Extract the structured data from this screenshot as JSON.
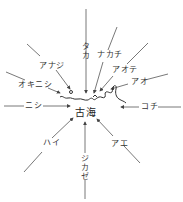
{
  "diagram": {
    "center_label": "古海",
    "winds": [
      {
        "id": "taka",
        "label": "タカ",
        "direction": "N"
      },
      {
        "id": "nakachi",
        "label": "ナカチ",
        "direction": "NNE"
      },
      {
        "id": "aote",
        "label": "アオテ",
        "direction": "NE"
      },
      {
        "id": "ao",
        "label": "アオ",
        "direction": "ENE"
      },
      {
        "id": "kochi",
        "label": "コチ",
        "direction": "E"
      },
      {
        "id": "ae",
        "label": "アエ",
        "direction": "SE"
      },
      {
        "id": "jikaze",
        "label": "ジカゼ",
        "direction": "S"
      },
      {
        "id": "hai",
        "label": "ハイ",
        "direction": "SW"
      },
      {
        "id": "nishi",
        "label": "ニシ",
        "direction": "W"
      },
      {
        "id": "okinishi",
        "label": "オキニシ",
        "direction": "WNW"
      },
      {
        "id": "anaji",
        "label": "アナジ",
        "direction": "NW"
      }
    ],
    "colors": {
      "line": "#444444",
      "text": "#333333",
      "background": "#ffffff"
    }
  }
}
